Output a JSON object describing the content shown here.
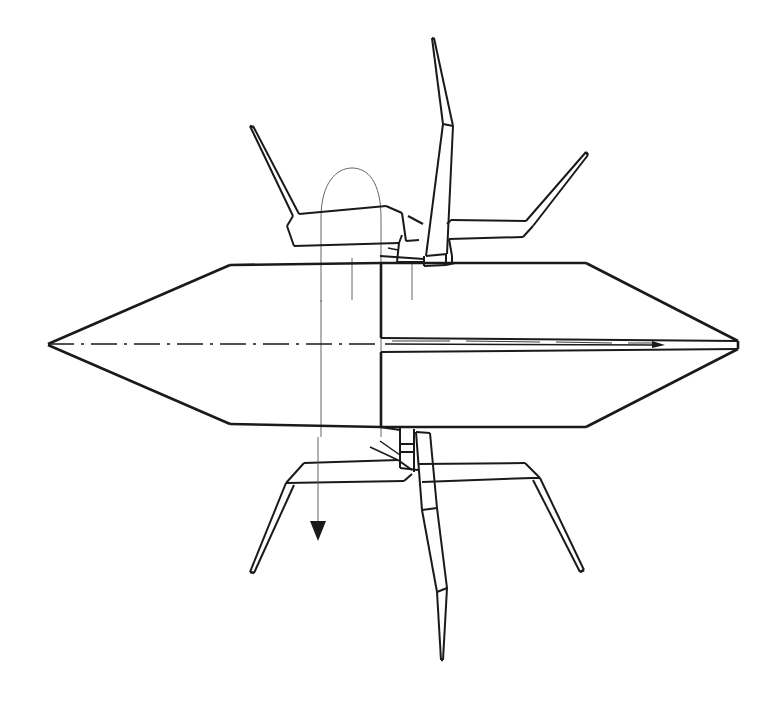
{
  "figure": {
    "caption_clipped_top": "reproduced from the original page header",
    "background_color": "#ffffff",
    "ink_color": "#1a1a1a",
    "view": "side elevation",
    "canvas": {
      "width": 780,
      "height": 727
    },
    "annotations": {
      "rotation_arc_label": "rotation arc indicator",
      "direction_arrow_label": "downward direction arrow",
      "centerline_label": "longitudinal centerline (dash-dot)"
    },
    "parts": [
      {
        "name": "chassis-body",
        "label": "Hexagonal chassis body"
      },
      {
        "name": "body-bulkhead",
        "label": "Central vertical bulkhead"
      },
      {
        "name": "body-slot",
        "label": "Horizontal slot band (right half)"
      },
      {
        "name": "upper-left-limb",
        "label": "Upper left limb"
      },
      {
        "name": "upper-mast",
        "label": "Upper central mast / antenna"
      },
      {
        "name": "upper-right-limb",
        "label": "Upper right limb"
      },
      {
        "name": "lower-left-limb",
        "label": "Lower left limb"
      },
      {
        "name": "lower-center-limb",
        "label": "Lower center limb"
      },
      {
        "name": "lower-right-limb",
        "label": "Lower right limb"
      },
      {
        "name": "upper-hub",
        "label": "Upper joint hub"
      },
      {
        "name": "lower-hub",
        "label": "Lower joint hub"
      }
    ]
  }
}
